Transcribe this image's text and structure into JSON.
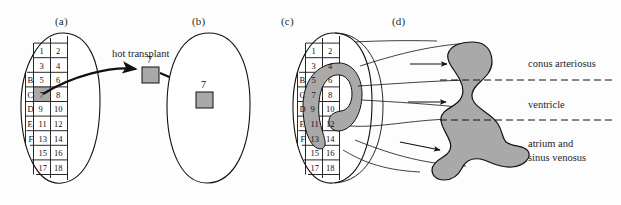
{
  "figure": {
    "background_color": "#fdfdfd",
    "shape_fill": "#a9a9a9",
    "line_color": "#111111"
  },
  "panels": [
    {
      "id": "a",
      "label": "(a)",
      "x": 55,
      "y": 15
    },
    {
      "id": "b",
      "label": "(b)",
      "x": 192,
      "y": 15
    },
    {
      "id": "c",
      "label": "(c)",
      "x": 281,
      "y": 15
    },
    {
      "id": "d",
      "label": "(d)",
      "x": 392,
      "y": 15
    }
  ],
  "annotations": {
    "hot_transplant": "hot transplant",
    "donor_square_number": "7",
    "host_square_number": "7"
  },
  "fate_map_grid": {
    "row_labels": [
      "",
      "",
      "B",
      "C",
      "D",
      "E",
      "F",
      "",
      ""
    ],
    "cells": [
      [
        "1",
        "2"
      ],
      [
        "3",
        "4"
      ],
      [
        "5",
        "6"
      ],
      [
        "7",
        "8"
      ],
      [
        "9",
        "10"
      ],
      [
        "11",
        "12"
      ],
      [
        "13",
        "14"
      ],
      [
        "15",
        "16"
      ],
      [
        "17",
        "18"
      ]
    ],
    "highlighted_cell": "7",
    "highlighted_row_label": "C"
  },
  "region_labels": [
    {
      "id": "conus",
      "text": "conus arteriosus",
      "x": 528,
      "y": 57
    },
    {
      "id": "ventricle",
      "text": "ventricle",
      "x": 528,
      "y": 98
    },
    {
      "id": "atrium",
      "line1": "atrium and",
      "line2": "sinus venosus",
      "x": 528,
      "y": 140
    }
  ],
  "projection_arrows": [
    {
      "id": "arrow-conus"
    },
    {
      "id": "arrow-ventricle"
    },
    {
      "id": "arrow-atrium"
    }
  ]
}
